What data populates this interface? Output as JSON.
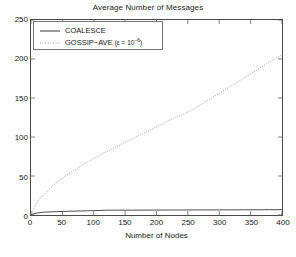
{
  "chart_data": {
    "type": "line",
    "title": "Average Number of Messages",
    "xlabel": "Number of Nodes",
    "ylabel": "",
    "xlim": [
      0,
      400
    ],
    "ylim": [
      0,
      250
    ],
    "xticks": [
      0,
      50,
      100,
      150,
      200,
      250,
      300,
      350,
      400
    ],
    "yticks": [
      0,
      50,
      100,
      150,
      200,
      250
    ],
    "grid": false,
    "legend_position": "upper left",
    "series": [
      {
        "name": "COALESCE",
        "style": "solid",
        "color": "#3a3a3a",
        "x": [
          0,
          10,
          20,
          30,
          40,
          50,
          60,
          70,
          80,
          90,
          100,
          110,
          120,
          140,
          160,
          180,
          200,
          220,
          240,
          260,
          280,
          300,
          320,
          340,
          360,
          380,
          400
        ],
        "y": [
          0.5,
          2.6,
          3.6,
          4.0,
          4.3,
          4.6,
          4.8,
          5.0,
          5.2,
          5.4,
          5.6,
          5.8,
          6.2,
          6.2,
          6.2,
          6.3,
          6.3,
          6.4,
          6.4,
          6.5,
          6.5,
          6.6,
          6.6,
          6.7,
          6.7,
          6.8,
          6.8
        ]
      },
      {
        "name": "GOSSIP-AVE",
        "style": "dotted",
        "color": "#8c8c8c",
        "x": [
          0,
          5,
          10,
          15,
          20,
          30,
          40,
          50,
          60,
          70,
          80,
          90,
          100,
          110,
          120,
          130,
          140,
          150,
          160,
          170,
          180,
          190,
          200,
          210,
          220,
          230,
          240,
          250,
          260,
          270,
          280,
          290,
          300,
          310,
          320,
          330,
          340,
          350,
          360,
          370,
          380,
          390,
          400
        ],
        "y": [
          0,
          9,
          17,
          22,
          26,
          34,
          41,
          47,
          53,
          58,
          63,
          68,
          72,
          77,
          81,
          85,
          89,
          93,
          97,
          101,
          105,
          109,
          113,
          117,
          121,
          125,
          128,
          132,
          136,
          141,
          146,
          151,
          156,
          161,
          166,
          171,
          176,
          181,
          186,
          191,
          196,
          201,
          205
        ]
      }
    ],
    "legend": [
      {
        "label": "COALESCE",
        "style": "solid"
      },
      {
        "label_prefix": "GOSSIP−AVE ",
        "eps_open": "(ε = 10",
        "eps_exp": "−6",
        "eps_close": ")",
        "style": "dotted"
      }
    ]
  }
}
